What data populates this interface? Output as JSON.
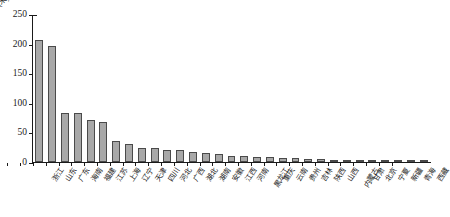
{
  "chart_data": {
    "type": "bar",
    "title": "",
    "subtitle": "",
    "xlabel": "",
    "ylabel": "",
    "unit_label": "(米)",
    "ylim": [
      0,
      250
    ],
    "yticks": [
      0,
      50,
      100,
      150,
      200,
      250
    ],
    "ytick_labels": [
      "0",
      "50",
      "100",
      "150",
      "200",
      "250"
    ],
    "grid": false,
    "legend": null,
    "orientation": "vertical",
    "bar_color": "#a8a8a8",
    "bar_edge_color": "#4a4a4a",
    "axis_color": "#1a1a1a",
    "categories": [
      "浙江",
      "山东",
      "广东",
      "海南",
      "福建",
      "江苏",
      "上海",
      "辽宁",
      "天津",
      "四川",
      "河北",
      "广西",
      "湖北",
      "湖南",
      "安徽",
      "江西",
      "河南",
      "黑龙江",
      "重庆",
      "云南",
      "贵州",
      "吉林",
      "陕西",
      "山西",
      "内蒙古",
      "甘肃",
      "北京",
      "宁夏",
      "新疆",
      "青海",
      "西藏"
    ],
    "values": [
      207,
      197,
      84,
      83,
      71,
      68,
      35,
      31,
      24,
      23,
      21,
      20,
      17,
      15,
      13,
      11,
      10,
      9,
      8,
      7,
      6,
      5,
      5,
      4,
      4,
      3,
      3,
      2,
      2,
      1,
      1
    ],
    "series": [
      {
        "name": "",
        "values": [
          207,
          197,
          84,
          83,
          71,
          68,
          35,
          31,
          24,
          23,
          21,
          20,
          17,
          15,
          13,
          11,
          10,
          9,
          8,
          7,
          6,
          5,
          5,
          4,
          4,
          3,
          3,
          2,
          2,
          1,
          1
        ]
      }
    ]
  }
}
